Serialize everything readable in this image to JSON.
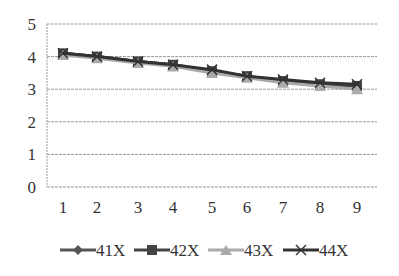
{
  "chart_data": {
    "type": "line",
    "title": "",
    "xlabel": "",
    "ylabel": "",
    "x": [
      1,
      2,
      3,
      4,
      5,
      6,
      7,
      8,
      9
    ],
    "categories": [
      "1",
      "2",
      "3",
      "4",
      "5",
      "6",
      "7",
      "8",
      "9"
    ],
    "ylim": [
      0,
      5
    ],
    "yticks": [
      0,
      1,
      2,
      3,
      4,
      5
    ],
    "grid": true,
    "legend_position": "bottom",
    "series": [
      {
        "name": "41X",
        "marker": "diamond",
        "color": "#555555",
        "values": [
          4.1,
          4.0,
          3.85,
          3.75,
          3.55,
          3.4,
          3.25,
          3.15,
          3.1
        ]
      },
      {
        "name": "42X",
        "marker": "square",
        "color": "#444444",
        "values": [
          4.1,
          4.0,
          3.85,
          3.75,
          3.55,
          3.4,
          3.25,
          3.15,
          3.1
        ]
      },
      {
        "name": "43X",
        "marker": "triangle",
        "color": "#aaaaaa",
        "values": [
          4.05,
          3.95,
          3.8,
          3.7,
          3.5,
          3.35,
          3.2,
          3.1,
          3.0
        ]
      },
      {
        "name": "44X",
        "marker": "x",
        "color": "#333333",
        "values": [
          4.1,
          4.0,
          3.85,
          3.75,
          3.6,
          3.4,
          3.3,
          3.2,
          3.15
        ]
      }
    ]
  }
}
